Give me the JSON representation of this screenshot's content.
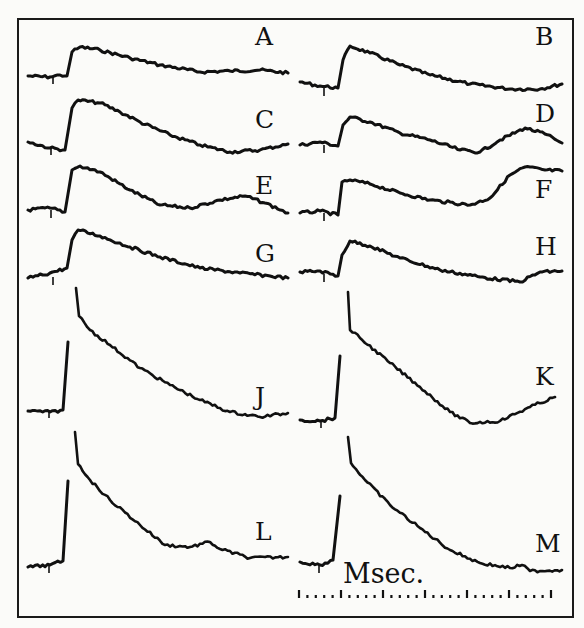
{
  "figure": {
    "frame": {
      "x": 18,
      "y": 19,
      "w": 555,
      "h": 598
    },
    "scale_label": "Msec.",
    "scale": {
      "x0": 299,
      "x1": 551,
      "y": 594,
      "long_tick_every": 5,
      "n_ticks": 31
    }
  },
  "chart_data": {
    "type": "line",
    "title": "",
    "xlabel": "Msec.",
    "ylabel": "",
    "grid": false,
    "layout": "2 columns x 6 rows of traces",
    "series": [
      {
        "name": "A",
        "label_pos": [
          255,
          45
        ],
        "baseline": 76,
        "x0": 28,
        "x1": 288,
        "onset": 67,
        "points": [
          [
            28,
            76
          ],
          [
            50,
            77
          ],
          [
            60,
            75
          ],
          [
            67,
            76
          ],
          [
            72,
            52
          ],
          [
            80,
            47
          ],
          [
            100,
            50
          ],
          [
            130,
            58
          ],
          [
            160,
            65
          ],
          [
            200,
            72
          ],
          [
            230,
            71
          ],
          [
            260,
            70
          ],
          [
            288,
            73
          ]
        ]
      },
      {
        "name": "B",
        "label_pos": [
          535,
          45
        ],
        "baseline": 88,
        "x0": 300,
        "x1": 562,
        "onset": 338,
        "points": [
          [
            300,
            82
          ],
          [
            320,
            86
          ],
          [
            338,
            88
          ],
          [
            343,
            60
          ],
          [
            350,
            46
          ],
          [
            370,
            53
          ],
          [
            400,
            65
          ],
          [
            430,
            75
          ],
          [
            470,
            84
          ],
          [
            510,
            89
          ],
          [
            540,
            89
          ],
          [
            562,
            84
          ]
        ]
      },
      {
        "name": "C",
        "label_pos": [
          255,
          128
        ],
        "baseline": 147,
        "x0": 28,
        "x1": 288,
        "onset": 65,
        "points": [
          [
            28,
            142
          ],
          [
            50,
            148
          ],
          [
            65,
            150
          ],
          [
            72,
            108
          ],
          [
            78,
            100
          ],
          [
            100,
            103
          ],
          [
            120,
            112
          ],
          [
            140,
            122
          ],
          [
            170,
            135
          ],
          [
            200,
            145
          ],
          [
            230,
            152
          ],
          [
            260,
            150
          ],
          [
            288,
            144
          ]
        ]
      },
      {
        "name": "D",
        "label_pos": [
          535,
          122
        ],
        "baseline": 145,
        "x0": 300,
        "x1": 562,
        "onset": 338,
        "points": [
          [
            300,
            145
          ],
          [
            320,
            142
          ],
          [
            338,
            146
          ],
          [
            343,
            125
          ],
          [
            350,
            117
          ],
          [
            370,
            122
          ],
          [
            400,
            133
          ],
          [
            430,
            140
          ],
          [
            460,
            150
          ],
          [
            480,
            152
          ],
          [
            500,
            140
          ],
          [
            525,
            128
          ],
          [
            545,
            134
          ],
          [
            562,
            143
          ]
        ]
      },
      {
        "name": "E",
        "label_pos": [
          255,
          194
        ],
        "baseline": 210,
        "x0": 28,
        "x1": 288,
        "onset": 65,
        "points": [
          [
            28,
            210
          ],
          [
            50,
            208
          ],
          [
            65,
            212
          ],
          [
            72,
            170
          ],
          [
            80,
            166
          ],
          [
            100,
            172
          ],
          [
            130,
            190
          ],
          [
            160,
            205
          ],
          [
            190,
            208
          ],
          [
            220,
            200
          ],
          [
            245,
            196
          ],
          [
            265,
            203
          ],
          [
            288,
            213
          ]
        ]
      },
      {
        "name": "F",
        "label_pos": [
          535,
          198
        ],
        "baseline": 213,
        "x0": 300,
        "x1": 562,
        "onset": 338,
        "points": [
          [
            300,
            213
          ],
          [
            320,
            211
          ],
          [
            338,
            215
          ],
          [
            342,
            182
          ],
          [
            350,
            180
          ],
          [
            370,
            184
          ],
          [
            400,
            193
          ],
          [
            430,
            200
          ],
          [
            470,
            205
          ],
          [
            490,
            198
          ],
          [
            510,
            175
          ],
          [
            525,
            167
          ],
          [
            545,
            170
          ],
          [
            562,
            171
          ]
        ]
      },
      {
        "name": "G",
        "label_pos": [
          255,
          262
        ],
        "baseline": 277,
        "x0": 28,
        "x1": 288,
        "onset": 67,
        "points": [
          [
            28,
            278
          ],
          [
            50,
            273
          ],
          [
            67,
            268
          ],
          [
            72,
            240
          ],
          [
            78,
            230
          ],
          [
            100,
            236
          ],
          [
            130,
            247
          ],
          [
            160,
            257
          ],
          [
            200,
            268
          ],
          [
            240,
            273
          ],
          [
            270,
            276
          ],
          [
            288,
            278
          ]
        ]
      },
      {
        "name": "H",
        "label_pos": [
          535,
          255
        ],
        "baseline": 274,
        "x0": 300,
        "x1": 562,
        "onset": 338,
        "points": [
          [
            300,
            272
          ],
          [
            320,
            271
          ],
          [
            338,
            276
          ],
          [
            342,
            255
          ],
          [
            350,
            241
          ],
          [
            370,
            246
          ],
          [
            400,
            258
          ],
          [
            440,
            270
          ],
          [
            480,
            277
          ],
          [
            520,
            282
          ],
          [
            540,
            272
          ],
          [
            562,
            271
          ]
        ]
      },
      {
        "name": "J",
        "label_pos": [
          255,
          405
        ],
        "baseline": 410,
        "x0": 28,
        "x1": 288,
        "onset": 63,
        "spike_peak": [
          68,
          342
        ],
        "spike_top": [
          76,
          288
        ],
        "points": [
          [
            28,
            411
          ],
          [
            50,
            412
          ],
          [
            63,
            410
          ],
          [
            68,
            342
          ]
        ],
        "decay": [
          [
            76,
            288
          ],
          [
            79,
            316
          ],
          [
            90,
            330
          ],
          [
            110,
            345
          ],
          [
            140,
            368
          ],
          [
            170,
            385
          ],
          [
            200,
            400
          ],
          [
            230,
            412
          ],
          [
            260,
            417
          ],
          [
            288,
            413
          ]
        ]
      },
      {
        "name": "K",
        "label_pos": [
          535,
          385
        ],
        "baseline": 420,
        "x0": 300,
        "x1": 562,
        "onset": 335,
        "spike_peak": [
          340,
          356
        ],
        "spike_top": [
          348,
          292
        ],
        "points": [
          [
            300,
            420
          ],
          [
            320,
            421
          ],
          [
            335,
            418
          ],
          [
            340,
            356
          ]
        ],
        "decay": [
          [
            348,
            292
          ],
          [
            350,
            330
          ],
          [
            360,
            338
          ],
          [
            390,
            363
          ],
          [
            420,
            387
          ],
          [
            450,
            412
          ],
          [
            470,
            423
          ],
          [
            500,
            421
          ],
          [
            530,
            407
          ],
          [
            555,
            397
          ]
        ]
      },
      {
        "name": "L",
        "label_pos": [
          255,
          540
        ],
        "baseline": 565,
        "x0": 28,
        "x1": 288,
        "onset": 63,
        "spike_peak": [
          68,
          481
        ],
        "spike_top": [
          75,
          432
        ],
        "points": [
          [
            28,
            567
          ],
          [
            50,
            565
          ],
          [
            63,
            561
          ],
          [
            68,
            481
          ]
        ],
        "decay": [
          [
            75,
            432
          ],
          [
            78,
            464
          ],
          [
            90,
            480
          ],
          [
            110,
            500
          ],
          [
            140,
            525
          ],
          [
            165,
            545
          ],
          [
            190,
            547
          ],
          [
            210,
            542
          ],
          [
            220,
            549
          ],
          [
            250,
            558
          ],
          [
            288,
            557
          ]
        ]
      },
      {
        "name": "M",
        "label_pos": [
          535,
          552
        ],
        "baseline": 565,
        "x0": 300,
        "x1": 562,
        "onset": 333,
        "spike_peak": [
          340,
          496
        ],
        "spike_top": [
          348,
          437
        ],
        "points": [
          [
            300,
            562
          ],
          [
            320,
            565
          ],
          [
            333,
            560
          ],
          [
            340,
            496
          ]
        ],
        "decay": [
          [
            348,
            437
          ],
          [
            351,
            463
          ],
          [
            365,
            480
          ],
          [
            390,
            505
          ],
          [
            420,
            528
          ],
          [
            450,
            550
          ],
          [
            480,
            563
          ],
          [
            510,
            568
          ],
          [
            522,
            565
          ],
          [
            530,
            571
          ],
          [
            562,
            570
          ]
        ]
      }
    ]
  }
}
